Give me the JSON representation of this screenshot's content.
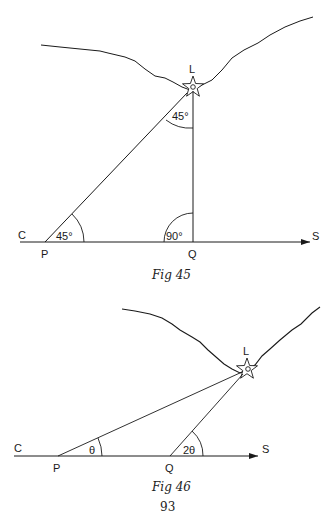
{
  "figures": [
    {
      "id": "fig45",
      "caption": "Fig 45",
      "landmark_label": "L",
      "points": {
        "C": "C",
        "P": "P",
        "Q": "Q",
        "S": "S"
      },
      "angles": {
        "at_P": "45°",
        "at_L": "45°",
        "at_Q": "90°"
      },
      "geometry": {
        "baseline_y": 242,
        "baseline_x_start": 20,
        "baseline_x_end": 310,
        "P_x": 45,
        "Q_x": 193,
        "L": [
          193,
          88
        ]
      }
    },
    {
      "id": "fig46",
      "caption": "Fig 46",
      "landmark_label": "L",
      "points": {
        "C": "C",
        "P": "P",
        "Q": "Q",
        "S": "S"
      },
      "angles": {
        "at_P": "θ",
        "at_Q": "2θ"
      },
      "geometry": {
        "baseline_y": 456,
        "baseline_x_start": 14,
        "baseline_x_end": 258,
        "P_x": 58,
        "Q_x": 170,
        "L": [
          247,
          371
        ]
      }
    }
  ],
  "page_number": "93",
  "colors": {
    "ink": "#1a1a1a",
    "background": "#ffffff"
  }
}
